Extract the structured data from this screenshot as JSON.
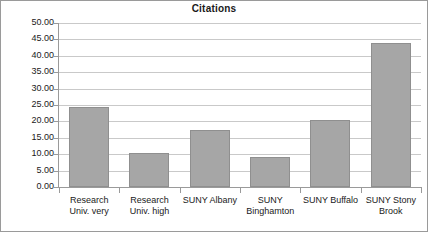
{
  "chart_data": {
    "type": "bar",
    "title": "Citations",
    "xlabel": "",
    "ylabel": "",
    "categories": [
      "Research Univ. very",
      "Research Univ. high",
      "SUNY Albany",
      "SUNY Binghamton",
      "SUNY Buffalo",
      "SUNY Stony Brook"
    ],
    "values": [
      24.5,
      10.3,
      17.5,
      9.3,
      20.5,
      44.0
    ],
    "ylim": [
      0,
      50
    ],
    "ytick_step": 5,
    "ytick_labels": [
      "50.00",
      "45.00",
      "40.00",
      "35.00",
      "30.00",
      "25.00",
      "20.00",
      "15.00",
      "10.00",
      "5.00",
      "0.00"
    ],
    "grid": true,
    "legend": false,
    "bar_color": "#a6a6a6",
    "bar_border_color": "#8f8f8f",
    "gridline_color": "#c9c9c9",
    "axis_color": "#9a9a9a",
    "text_color": "#1a1a1a"
  }
}
